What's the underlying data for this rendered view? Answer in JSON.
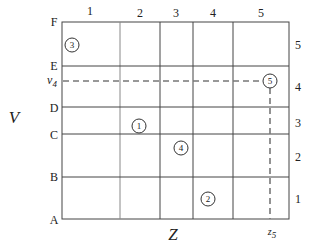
{
  "diagram": {
    "axes": {
      "horizontal_label": "Z",
      "vertical_label": "V"
    },
    "top_labels": [
      "1",
      "2",
      "3",
      "4",
      "5"
    ],
    "left_labels": [
      "F",
      "E",
      "D",
      "C",
      "B",
      "A"
    ],
    "right_labels": [
      "5",
      "4",
      "3",
      "2",
      "1"
    ],
    "marker_v": {
      "base": "v",
      "sub": "4"
    },
    "marker_z": {
      "base": "z",
      "sub": "5"
    },
    "points": [
      {
        "id": "1",
        "label": "1"
      },
      {
        "id": "2",
        "label": "2"
      },
      {
        "id": "3",
        "label": "3"
      },
      {
        "id": "4",
        "label": "4"
      },
      {
        "id": "5",
        "label": "5"
      }
    ],
    "colors": {
      "grid": "#444444",
      "dashed": "#777777"
    }
  }
}
